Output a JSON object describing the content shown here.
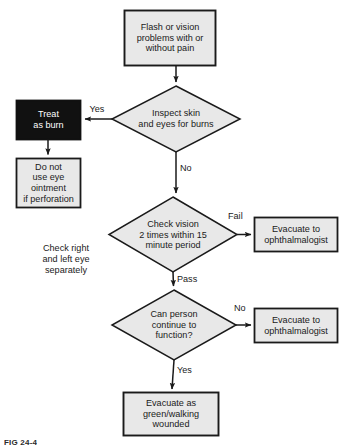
{
  "figure": {
    "caption": "FIG 24-4",
    "colors": {
      "shape_fill": "#e8e8e8",
      "shape_stroke": "#1a1a1a",
      "terminal_fill": "#111111",
      "terminal_text": "#ffffff",
      "text": "#1a1a1a",
      "background": "#ffffff"
    }
  },
  "nodes": {
    "start": {
      "id": "start",
      "shape": "rectangle",
      "label": "Flash or vision\nproblems with or\nwithout pain",
      "fill": "#e8e8e8"
    },
    "inspect": {
      "id": "inspect",
      "shape": "diamond",
      "label": "Inspect skin\nand eyes for burns",
      "fill": "#e8e8e8"
    },
    "treat_burn": {
      "id": "treat_burn",
      "shape": "rectangle",
      "label": "Treat\nas burn",
      "fill": "#111111"
    },
    "no_ointment": {
      "id": "no_ointment",
      "shape": "rectangle",
      "label": "Do not\nuse eye\nointment\nif perforation",
      "fill": "#e8e8e8"
    },
    "check_vision": {
      "id": "check_vision",
      "shape": "diamond",
      "label": "Check vision\n2 times within 15\nminute period",
      "fill": "#e8e8e8"
    },
    "evac_fail": {
      "id": "evac_fail",
      "shape": "rectangle",
      "label": "Evacuate to\nophthalmalogist",
      "fill": "#e8e8e8"
    },
    "can_function": {
      "id": "can_function",
      "shape": "diamond",
      "label": "Can person\ncontinue to\nfunction?",
      "fill": "#e8e8e8"
    },
    "evac_no": {
      "id": "evac_no",
      "shape": "rectangle",
      "label": "Evacuate to\nophthalmalogist",
      "fill": "#e8e8e8"
    },
    "evac_green": {
      "id": "evac_green",
      "shape": "rectangle",
      "label": "Evacuate as\ngreen/walking\nwounded",
      "fill": "#e8e8e8"
    }
  },
  "edge_labels": {
    "yes_burn": "Yes",
    "no_burn": "No",
    "fail_vision": "Fail",
    "pass_vision": "Pass",
    "no_function": "No",
    "yes_function": "Yes"
  },
  "notes": {
    "check_eyes": "Check right\nand left eye\nseparately"
  }
}
